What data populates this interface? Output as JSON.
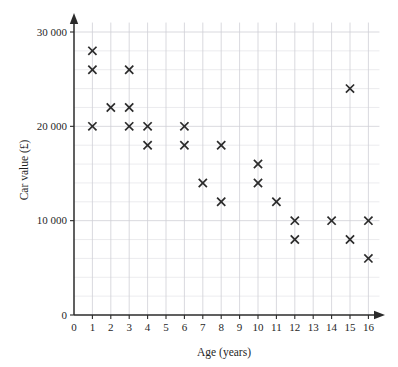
{
  "chart_data": {
    "type": "scatter",
    "title": "",
    "xlabel": "Age (years)",
    "ylabel": "Car value (£)",
    "xlim": [
      0,
      16.6
    ],
    "ylim": [
      0,
      31000
    ],
    "grid": true,
    "legend": "none",
    "x_ticks": [
      0,
      1,
      2,
      3,
      4,
      5,
      6,
      7,
      8,
      9,
      10,
      11,
      12,
      13,
      14,
      15,
      16
    ],
    "x_tick_labels": [
      "0",
      "1",
      "2",
      "3",
      "4",
      "5",
      "6",
      "7",
      "8",
      "9",
      "10",
      "11",
      "12",
      "13",
      "14",
      "15",
      "16"
    ],
    "y_ticks": [
      0,
      10000,
      20000,
      30000
    ],
    "y_tick_labels": [
      "0",
      "10 000",
      "20 000",
      "30 000"
    ],
    "y_minor_step": 2000,
    "x_minor_step": 1,
    "marker_style": "x",
    "marker_color": "#2b2b2b",
    "points": [
      {
        "x": 1,
        "y": 28000
      },
      {
        "x": 1,
        "y": 26000
      },
      {
        "x": 1,
        "y": 20000
      },
      {
        "x": 2,
        "y": 22000
      },
      {
        "x": 3,
        "y": 26000
      },
      {
        "x": 3,
        "y": 22000
      },
      {
        "x": 3,
        "y": 20000
      },
      {
        "x": 4,
        "y": 20000
      },
      {
        "x": 4,
        "y": 18000
      },
      {
        "x": 6,
        "y": 20000
      },
      {
        "x": 6,
        "y": 18000
      },
      {
        "x": 7,
        "y": 14000
      },
      {
        "x": 8,
        "y": 18000
      },
      {
        "x": 8,
        "y": 12000
      },
      {
        "x": 10,
        "y": 16000
      },
      {
        "x": 10,
        "y": 14000
      },
      {
        "x": 11,
        "y": 12000
      },
      {
        "x": 12,
        "y": 10000
      },
      {
        "x": 12,
        "y": 8000
      },
      {
        "x": 14,
        "y": 10000
      },
      {
        "x": 15,
        "y": 24000
      },
      {
        "x": 15,
        "y": 8000
      },
      {
        "x": 16,
        "y": 10000
      },
      {
        "x": 16,
        "y": 6000
      }
    ]
  }
}
